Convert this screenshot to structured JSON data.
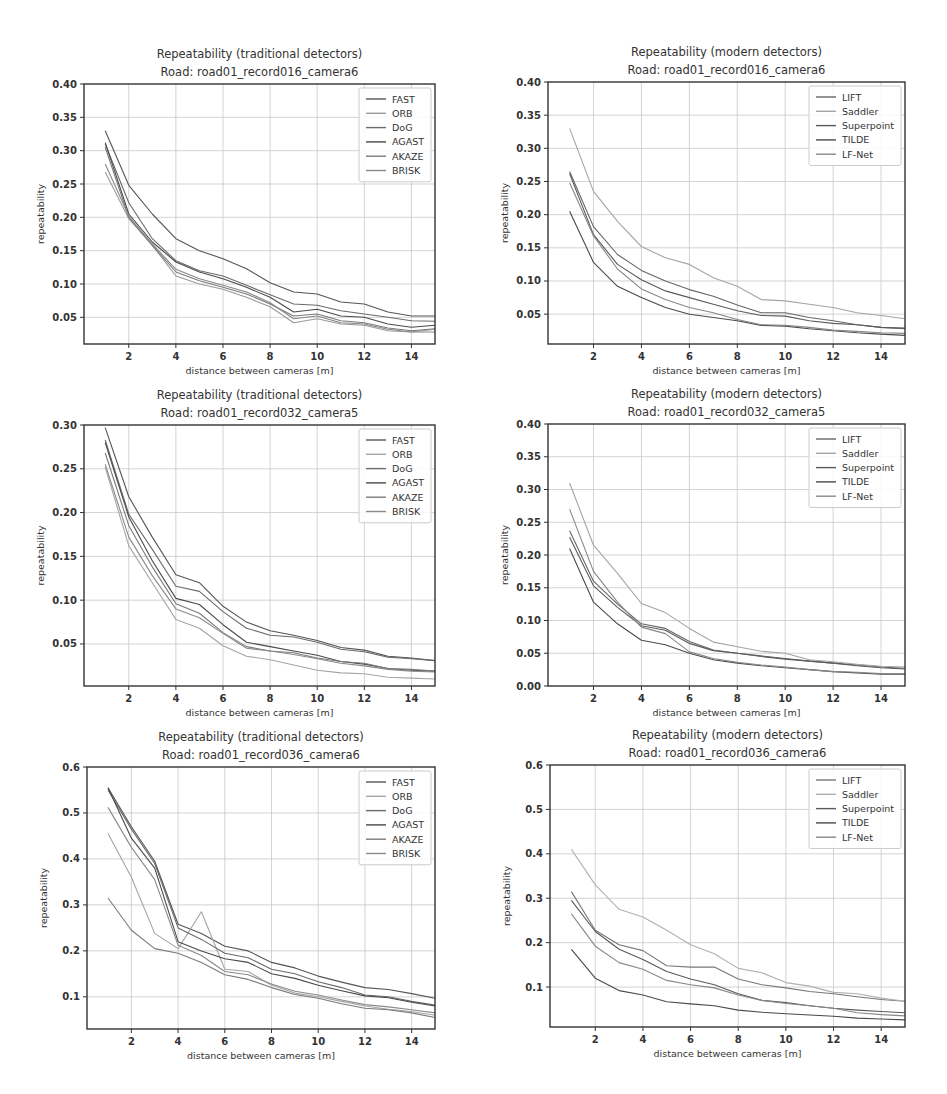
{
  "chart_data": [
    {
      "id": "p1",
      "type": "line",
      "title": "Repeatability (traditional detectors)",
      "subtitle": "Road: road01_record016_camera6",
      "xlabel": "distance between cameras [m]",
      "ylabel": "repeatability",
      "xlim": [
        0.1,
        15
      ],
      "ylim": [
        0.01,
        0.4
      ],
      "xticks": [
        2,
        4,
        6,
        8,
        10,
        12,
        14
      ],
      "yticks": [
        0.05,
        0.1,
        0.15,
        0.2,
        0.25,
        0.3,
        0.35,
        0.4
      ],
      "ytick_labels": [
        "0.05",
        "0.10",
        "0.15",
        "0.20",
        "0.25",
        "0.30",
        "0.35",
        "0.40"
      ],
      "grid": true,
      "legend_position": "upper right",
      "x": [
        1,
        2,
        3,
        4,
        5,
        6,
        7,
        8,
        9,
        10,
        11,
        12,
        13,
        14,
        15
      ],
      "series": [
        {
          "name": "FAST",
          "color": "#555555",
          "values": [
            0.33,
            0.248,
            0.205,
            0.168,
            0.15,
            0.138,
            0.123,
            0.102,
            0.088,
            0.085,
            0.073,
            0.07,
            0.058,
            0.052,
            0.052
          ]
        },
        {
          "name": "ORB",
          "color": "#9a9a9a",
          "values": [
            0.268,
            0.198,
            0.158,
            0.112,
            0.1,
            0.092,
            0.08,
            0.066,
            0.042,
            0.048,
            0.04,
            0.038,
            0.03,
            0.028,
            0.032
          ]
        },
        {
          "name": "DoG",
          "color": "#6a6a6a",
          "values": [
            0.31,
            0.222,
            0.168,
            0.135,
            0.12,
            0.112,
            0.098,
            0.084,
            0.07,
            0.068,
            0.06,
            0.055,
            0.05,
            0.045,
            0.044
          ]
        },
        {
          "name": "AGAST",
          "color": "#4a4a4a",
          "values": [
            0.312,
            0.205,
            0.163,
            0.133,
            0.118,
            0.108,
            0.095,
            0.08,
            0.058,
            0.062,
            0.052,
            0.05,
            0.04,
            0.035,
            0.038
          ]
        },
        {
          "name": "AKAZE",
          "color": "#7a7a7a",
          "values": [
            0.305,
            0.2,
            0.158,
            0.118,
            0.105,
            0.095,
            0.085,
            0.07,
            0.052,
            0.055,
            0.045,
            0.042,
            0.034,
            0.03,
            0.033
          ]
        },
        {
          "name": "BRISK",
          "color": "#888888",
          "values": [
            0.28,
            0.202,
            0.16,
            0.122,
            0.108,
            0.098,
            0.088,
            0.072,
            0.048,
            0.052,
            0.042,
            0.04,
            0.032,
            0.028,
            0.028
          ]
        }
      ]
    },
    {
      "id": "p2",
      "type": "line",
      "title": "Repeatability (modern detectors)",
      "subtitle": "Road: road01_record016_camera6",
      "xlabel": "distance between cameras [m]",
      "ylabel": "repeatability",
      "xlim": [
        0.1,
        15
      ],
      "ylim": [
        0.005,
        0.4
      ],
      "xticks": [
        2,
        4,
        6,
        8,
        10,
        12,
        14
      ],
      "yticks": [
        0.05,
        0.1,
        0.15,
        0.2,
        0.25,
        0.3,
        0.35,
        0.4
      ],
      "ytick_labels": [
        "0.05",
        "0.10",
        "0.15",
        "0.20",
        "0.25",
        "0.30",
        "0.35",
        "0.40"
      ],
      "grid": true,
      "legend_position": "upper right",
      "x": [
        1,
        2,
        3,
        4,
        5,
        6,
        7,
        8,
        9,
        10,
        11,
        12,
        13,
        14,
        15
      ],
      "series": [
        {
          "name": "LIFT",
          "color": "#666666",
          "values": [
            0.265,
            0.182,
            0.14,
            0.116,
            0.1,
            0.087,
            0.077,
            0.064,
            0.052,
            0.052,
            0.045,
            0.04,
            0.034,
            0.03,
            0.028
          ]
        },
        {
          "name": "Saddler",
          "color": "#a5a5a5",
          "values": [
            0.33,
            0.235,
            0.19,
            0.152,
            0.135,
            0.125,
            0.105,
            0.092,
            0.072,
            0.07,
            0.065,
            0.06,
            0.052,
            0.048,
            0.043
          ]
        },
        {
          "name": "Superpoint",
          "color": "#5a5a5a",
          "values": [
            0.262,
            0.17,
            0.125,
            0.102,
            0.085,
            0.075,
            0.065,
            0.055,
            0.048,
            0.047,
            0.04,
            0.036,
            0.034,
            0.03,
            0.029
          ]
        },
        {
          "name": "TILDE",
          "color": "#4a4a4a",
          "values": [
            0.205,
            0.128,
            0.092,
            0.075,
            0.06,
            0.05,
            0.045,
            0.04,
            0.033,
            0.032,
            0.028,
            0.025,
            0.022,
            0.02,
            0.018
          ]
        },
        {
          "name": "LF-Net",
          "color": "#888888",
          "values": [
            0.248,
            0.168,
            0.118,
            0.088,
            0.072,
            0.06,
            0.052,
            0.042,
            0.034,
            0.033,
            0.03,
            0.026,
            0.024,
            0.022,
            0.021
          ]
        }
      ]
    },
    {
      "id": "p3",
      "type": "line",
      "title": "Repeatability (traditional detectors)",
      "subtitle": "Road: road01_record032_camera5",
      "xlabel": "distance between cameras [m]",
      "ylabel": "repeatability",
      "xlim": [
        0.1,
        15
      ],
      "ylim": [
        0.002,
        0.3
      ],
      "xticks": [
        2,
        4,
        6,
        8,
        10,
        12,
        14
      ],
      "yticks": [
        0.05,
        0.1,
        0.15,
        0.2,
        0.25,
        0.3
      ],
      "ytick_labels": [
        "0.05",
        "0.10",
        "0.15",
        "0.20",
        "0.25",
        "0.30"
      ],
      "grid": true,
      "legend_position": "upper right",
      "x": [
        1,
        2,
        3,
        4,
        5,
        6,
        7,
        8,
        9,
        10,
        11,
        12,
        13,
        14,
        15
      ],
      "series": [
        {
          "name": "FAST",
          "color": "#555555",
          "values": [
            0.297,
            0.218,
            0.172,
            0.129,
            0.12,
            0.093,
            0.075,
            0.065,
            0.06,
            0.054,
            0.046,
            0.043,
            0.036,
            0.034,
            0.031
          ]
        },
        {
          "name": "ORB",
          "color": "#a5a5a5",
          "values": [
            0.252,
            0.162,
            0.12,
            0.078,
            0.068,
            0.048,
            0.036,
            0.032,
            0.026,
            0.02,
            0.017,
            0.016,
            0.012,
            0.011,
            0.01
          ]
        },
        {
          "name": "DoG",
          "color": "#6a6a6a",
          "values": [
            0.283,
            0.198,
            0.158,
            0.116,
            0.11,
            0.087,
            0.068,
            0.06,
            0.058,
            0.052,
            0.044,
            0.041,
            0.035,
            0.033,
            0.031
          ]
        },
        {
          "name": "AGAST",
          "color": "#4a4a4a",
          "values": [
            0.28,
            0.195,
            0.145,
            0.102,
            0.095,
            0.072,
            0.052,
            0.047,
            0.042,
            0.037,
            0.03,
            0.027,
            0.022,
            0.02,
            0.019
          ]
        },
        {
          "name": "AKAZE",
          "color": "#7a7a7a",
          "values": [
            0.268,
            0.185,
            0.138,
            0.096,
            0.085,
            0.063,
            0.047,
            0.042,
            0.04,
            0.034,
            0.03,
            0.028,
            0.022,
            0.021,
            0.019
          ]
        },
        {
          "name": "BRISK",
          "color": "#8a8a8a",
          "values": [
            0.255,
            0.172,
            0.128,
            0.09,
            0.08,
            0.062,
            0.045,
            0.042,
            0.038,
            0.033,
            0.028,
            0.025,
            0.021,
            0.019,
            0.018
          ]
        }
      ]
    },
    {
      "id": "p4",
      "type": "line",
      "title": "Repeatability (modern detectors)",
      "subtitle": "Road: road01_record032_camera5",
      "xlabel": "distance between cameras [m]",
      "ylabel": "repeatability",
      "xlim": [
        0.1,
        15
      ],
      "ylim": [
        0.0,
        0.4
      ],
      "xticks": [
        2,
        4,
        6,
        8,
        10,
        12,
        14
      ],
      "yticks": [
        0.0,
        0.05,
        0.1,
        0.15,
        0.2,
        0.25,
        0.3,
        0.35,
        0.4
      ],
      "ytick_labels": [
        "0.00",
        "0.05",
        "0.10",
        "0.15",
        "0.20",
        "0.25",
        "0.30",
        "0.35",
        "0.40"
      ],
      "grid": true,
      "legend_position": "upper right",
      "x": [
        1,
        2,
        3,
        4,
        5,
        6,
        7,
        8,
        9,
        10,
        11,
        12,
        13,
        14,
        15
      ],
      "series": [
        {
          "name": "LIFT",
          "color": "#666666",
          "values": [
            0.237,
            0.16,
            0.125,
            0.095,
            0.088,
            0.068,
            0.055,
            0.05,
            0.046,
            0.042,
            0.038,
            0.035,
            0.032,
            0.029,
            0.027
          ]
        },
        {
          "name": "Saddler",
          "color": "#a5a5a5",
          "values": [
            0.31,
            0.215,
            0.172,
            0.126,
            0.112,
            0.088,
            0.067,
            0.06,
            0.053,
            0.05,
            0.04,
            0.037,
            0.033,
            0.03,
            0.029
          ]
        },
        {
          "name": "Superpoint",
          "color": "#5a5a5a",
          "values": [
            0.227,
            0.153,
            0.12,
            0.092,
            0.085,
            0.065,
            0.054,
            0.05,
            0.045,
            0.041,
            0.038,
            0.035,
            0.031,
            0.028,
            0.026
          ]
        },
        {
          "name": "TILDE",
          "color": "#4a4a4a",
          "values": [
            0.21,
            0.128,
            0.095,
            0.07,
            0.063,
            0.05,
            0.04,
            0.035,
            0.031,
            0.028,
            0.025,
            0.022,
            0.02,
            0.018,
            0.018
          ]
        },
        {
          "name": "LF-Net",
          "color": "#888888",
          "values": [
            0.27,
            0.175,
            0.128,
            0.09,
            0.08,
            0.052,
            0.042,
            0.036,
            0.032,
            0.029,
            0.025,
            0.022,
            0.021,
            0.019,
            0.019
          ]
        }
      ]
    },
    {
      "id": "p5",
      "type": "line",
      "title": "Repeatability (traditional detectors)",
      "subtitle": "Road: road01_record036_camera6",
      "xlabel": "distance between cameras [m]",
      "ylabel": "repeatability",
      "xlim": [
        0.1,
        15
      ],
      "ylim": [
        0.03,
        0.6
      ],
      "xticks": [
        2,
        4,
        6,
        8,
        10,
        12,
        14
      ],
      "yticks": [
        0.1,
        0.2,
        0.3,
        0.4,
        0.5,
        0.6
      ],
      "ytick_labels": [
        "0.1",
        "0.2",
        "0.3",
        "0.4",
        "0.5",
        "0.6"
      ],
      "grid": true,
      "legend_position": "upper right",
      "x": [
        1,
        2,
        3,
        4,
        5,
        6,
        7,
        8,
        9,
        10,
        11,
        12,
        13,
        14,
        15
      ],
      "series": [
        {
          "name": "FAST",
          "color": "#555555",
          "values": [
            0.555,
            0.47,
            0.395,
            0.258,
            0.238,
            0.21,
            0.2,
            0.175,
            0.163,
            0.145,
            0.132,
            0.12,
            0.116,
            0.107,
            0.097
          ]
        },
        {
          "name": "ORB",
          "color": "#a5a5a5",
          "values": [
            0.455,
            0.36,
            0.238,
            0.205,
            0.285,
            0.16,
            0.155,
            0.125,
            0.108,
            0.1,
            0.09,
            0.08,
            0.073,
            0.068,
            0.06
          ]
        },
        {
          "name": "DoG",
          "color": "#6a6a6a",
          "values": [
            0.55,
            0.465,
            0.39,
            0.25,
            0.225,
            0.195,
            0.185,
            0.16,
            0.15,
            0.133,
            0.12,
            0.104,
            0.1,
            0.09,
            0.082
          ]
        },
        {
          "name": "AGAST",
          "color": "#4a4a4a",
          "values": [
            0.555,
            0.445,
            0.38,
            0.22,
            0.2,
            0.183,
            0.175,
            0.15,
            0.14,
            0.125,
            0.113,
            0.102,
            0.098,
            0.088,
            0.08
          ]
        },
        {
          "name": "AKAZE",
          "color": "#7a7a7a",
          "values": [
            0.315,
            0.245,
            0.205,
            0.195,
            0.175,
            0.148,
            0.138,
            0.12,
            0.105,
            0.097,
            0.085,
            0.075,
            0.072,
            0.065,
            0.055
          ]
        },
        {
          "name": "BRISK",
          "color": "#8a8a8a",
          "values": [
            0.512,
            0.425,
            0.355,
            0.212,
            0.19,
            0.155,
            0.148,
            0.128,
            0.112,
            0.104,
            0.093,
            0.083,
            0.078,
            0.072,
            0.065
          ]
        }
      ]
    },
    {
      "id": "p6",
      "type": "line",
      "title": "Repeatability (modern detectors)",
      "subtitle": "Road: road01_record036_camera6",
      "xlabel": "distance between cameras [m]",
      "ylabel": "repeatability",
      "xlim": [
        0.1,
        15
      ],
      "ylim": [
        0.01,
        0.6
      ],
      "xticks": [
        2,
        4,
        6,
        8,
        10,
        12,
        14
      ],
      "yticks": [
        0.1,
        0.2,
        0.3,
        0.4,
        0.5,
        0.6
      ],
      "ytick_labels": [
        "0.1",
        "0.2",
        "0.3",
        "0.4",
        "0.5",
        "0.6"
      ],
      "grid": true,
      "legend_position": "upper right",
      "x": [
        1,
        2,
        3,
        4,
        5,
        6,
        7,
        8,
        9,
        10,
        11,
        12,
        13,
        14,
        15
      ],
      "series": [
        {
          "name": "LIFT",
          "color": "#777777",
          "values": [
            0.315,
            0.228,
            0.195,
            0.182,
            0.148,
            0.145,
            0.145,
            0.118,
            0.105,
            0.098,
            0.09,
            0.085,
            0.078,
            0.072,
            0.068
          ]
        },
        {
          "name": "Saddler",
          "color": "#b0b0b0",
          "values": [
            0.41,
            0.33,
            0.275,
            0.258,
            0.228,
            0.195,
            0.175,
            0.142,
            0.132,
            0.11,
            0.102,
            0.088,
            0.085,
            0.075,
            0.068
          ]
        },
        {
          "name": "Superpoint",
          "color": "#5a5a5a",
          "values": [
            0.295,
            0.225,
            0.185,
            0.162,
            0.135,
            0.118,
            0.105,
            0.085,
            0.07,
            0.065,
            0.058,
            0.052,
            0.048,
            0.045,
            0.042
          ]
        },
        {
          "name": "TILDE",
          "color": "#4a4a4a",
          "values": [
            0.185,
            0.12,
            0.092,
            0.082,
            0.067,
            0.062,
            0.058,
            0.048,
            0.043,
            0.04,
            0.037,
            0.034,
            0.03,
            0.028,
            0.026
          ]
        },
        {
          "name": "LF-Net",
          "color": "#888888",
          "values": [
            0.265,
            0.192,
            0.155,
            0.14,
            0.115,
            0.105,
            0.098,
            0.082,
            0.07,
            0.063,
            0.058,
            0.052,
            0.042,
            0.038,
            0.035
          ]
        }
      ]
    }
  ],
  "layout": {
    "panels": [
      {
        "id": "p1",
        "left": 84,
        "top": 84,
        "width": 351,
        "height": 260
      },
      {
        "id": "p2",
        "left": 548,
        "top": 82,
        "width": 357,
        "height": 262
      },
      {
        "id": "p3",
        "left": 84,
        "top": 425,
        "width": 351,
        "height": 261
      },
      {
        "id": "p4",
        "left": 548,
        "top": 424,
        "width": 357,
        "height": 262
      },
      {
        "id": "p5",
        "left": 87,
        "top": 767,
        "width": 348,
        "height": 262
      },
      {
        "id": "p6",
        "left": 550,
        "top": 765,
        "width": 355,
        "height": 262
      }
    ]
  }
}
